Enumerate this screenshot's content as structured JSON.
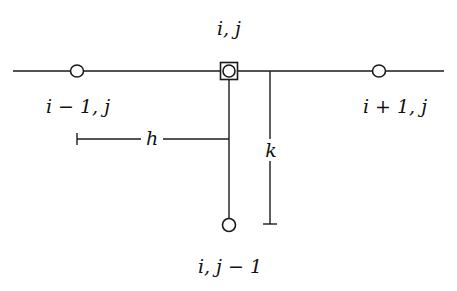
{
  "diagram": {
    "type": "finite-difference-stencil",
    "nodes": [
      {
        "id": "center",
        "label": "i, j",
        "marker": "square-circle"
      },
      {
        "id": "left",
        "label": "i − 1, j",
        "marker": "circle"
      },
      {
        "id": "right",
        "label": "i + 1, j",
        "marker": "circle"
      },
      {
        "id": "below",
        "label": "i, j − 1",
        "marker": "circle"
      }
    ],
    "dimensions": {
      "horizontal_spacing": "h",
      "vertical_spacing": "k"
    }
  },
  "colors": {
    "line": "#1a1a1a",
    "background": "#ffffff"
  }
}
